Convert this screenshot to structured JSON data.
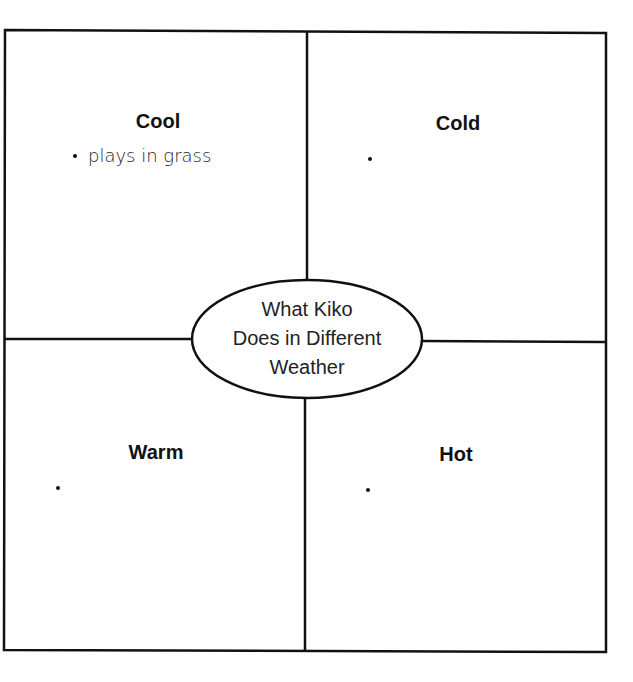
{
  "diagram": {
    "center": {
      "lines": [
        "What Kiko",
        "Does in Different",
        "Weather"
      ]
    },
    "quadrants": [
      {
        "position": "top-left",
        "heading": "Cool",
        "bullets": [
          "plays in grass"
        ]
      },
      {
        "position": "top-right",
        "heading": "Cold",
        "bullets": [
          ""
        ]
      },
      {
        "position": "bottom-left",
        "heading": "Warm",
        "bullets": [
          ""
        ]
      },
      {
        "position": "bottom-right",
        "heading": "Hot",
        "bullets": [
          ""
        ]
      }
    ],
    "colors": {
      "line": "#111111",
      "background": "#ffffff"
    }
  }
}
